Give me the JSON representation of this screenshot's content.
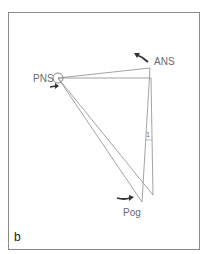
{
  "figure": {
    "panel_label": "b",
    "labels": {
      "pns": "PNS",
      "ans": "ANS",
      "pog": "Pog",
      "angle": "1"
    },
    "colors": {
      "frame": "#8a8a8a",
      "lines": "#8c8c8c",
      "arrows": "#333333",
      "text": "#6a6a6a"
    }
  }
}
